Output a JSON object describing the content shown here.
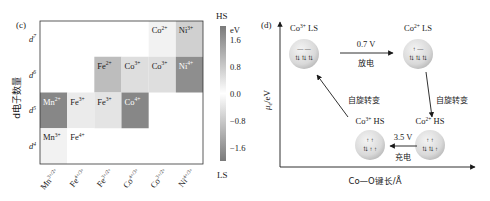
{
  "chart_data": [
    {
      "type": "heatmap",
      "panel_label": "(c)",
      "ylabel": "d电子数量",
      "y_ticks": [
        {
          "base": "d",
          "sup": "7"
        },
        {
          "base": "d",
          "sup": "6"
        },
        {
          "base": "d",
          "sup": "5"
        },
        {
          "base": "d",
          "sup": "4"
        }
      ],
      "x_ticks": [
        {
          "base": "Mn",
          "sup": "3+/2+"
        },
        {
          "base": "Fe",
          "sup": "4+/3+"
        },
        {
          "base": "Fe",
          "sup": "3+/2+"
        },
        {
          "base": "Co",
          "sup": "4+/3+"
        },
        {
          "base": "Co",
          "sup": "3+/2+"
        },
        {
          "base": "Ni",
          "sup": "4+/3+"
        }
      ],
      "cells": [
        {
          "row": 0,
          "col": 4,
          "base": "Co",
          "sup": "2+",
          "value": 0.2
        },
        {
          "row": 0,
          "col": 5,
          "base": "Ni",
          "sup": "3+",
          "value": 0.7
        },
        {
          "row": 1,
          "col": 2,
          "base": "Fe",
          "sup": "2+",
          "value": 1.0
        },
        {
          "row": 1,
          "col": 3,
          "base": "Co",
          "sup": "3+",
          "value": 0.5
        },
        {
          "row": 1,
          "col": 4,
          "base": "Co",
          "sup": "3+",
          "value": 0.5
        },
        {
          "row": 1,
          "col": 5,
          "base": "Ni",
          "sup": "4+",
          "value": -1.7
        },
        {
          "row": 2,
          "col": 0,
          "base": "Mn",
          "sup": "2+",
          "value": 1.8
        },
        {
          "row": 2,
          "col": 1,
          "base": "Fe",
          "sup": "3+",
          "value": 0.3
        },
        {
          "row": 2,
          "col": 2,
          "base": "Fe",
          "sup": "3+",
          "value": 0.4
        },
        {
          "row": 2,
          "col": 3,
          "base": "Co",
          "sup": "4+",
          "value": -1.8
        },
        {
          "row": 3,
          "col": 0,
          "base": "Mn",
          "sup": "3+",
          "value": 0.2
        },
        {
          "row": 3,
          "col": 1,
          "base": "Fe",
          "sup": "4+",
          "value": 0.0
        }
      ],
      "colorbar": {
        "top_label": "HS",
        "bottom_label": "LS",
        "unit": "eV",
        "ticks": [
          "1.6",
          "0.8",
          "0.0",
          "−0.8",
          "−1.6"
        ],
        "range": [
          -2.0,
          2.0
        ]
      }
    },
    {
      "type": "diagram",
      "panel_label": "(d)",
      "ylabel_main": "μ",
      "ylabel_sub": "e",
      "ylabel_unit": "/eV",
      "xlabel": "Co—O键长/Å",
      "states": [
        {
          "id": "co3-ls",
          "base": "Co",
          "sup": "3+",
          "spin": "LS"
        },
        {
          "id": "co2-ls",
          "base": "Co",
          "sup": "2+",
          "spin": "LS"
        },
        {
          "id": "co2-hs",
          "base": "Co",
          "sup": "2+",
          "spin": "HS"
        },
        {
          "id": "co3-hs",
          "base": "Co",
          "sup": "3+",
          "spin": "HS"
        }
      ],
      "transitions": [
        {
          "from": "co3-ls",
          "to": "co2-ls",
          "top": "0.7 V",
          "bottom": "放电"
        },
        {
          "from": "co2-ls",
          "to": "co2-hs",
          "label": "自旋转变"
        },
        {
          "from": "co2-hs",
          "to": "co3-hs",
          "top": "3.5 V",
          "bottom": "充电"
        },
        {
          "from": "co3-hs",
          "to": "co3-ls",
          "label": "自旋转变"
        }
      ]
    }
  ]
}
